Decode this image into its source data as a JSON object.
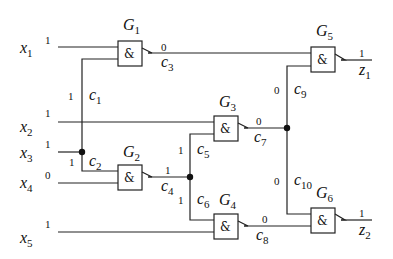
{
  "diagram": {
    "type": "logic-circuit",
    "gate_symbol": "&",
    "inputs": [
      {
        "id": "x1",
        "name": "x",
        "sub": "1",
        "value": "1"
      },
      {
        "id": "x2",
        "name": "x",
        "sub": "2",
        "value": "1"
      },
      {
        "id": "x3",
        "name": "x",
        "sub": "3",
        "value": "1"
      },
      {
        "id": "x4",
        "name": "x",
        "sub": "4",
        "value": "0"
      },
      {
        "id": "x5",
        "name": "x",
        "sub": "5",
        "value": "1"
      }
    ],
    "gates": [
      {
        "id": "G1",
        "name": "G",
        "sub": "1",
        "symbol": "&"
      },
      {
        "id": "G2",
        "name": "G",
        "sub": "2",
        "symbol": "&"
      },
      {
        "id": "G3",
        "name": "G",
        "sub": "3",
        "symbol": "&"
      },
      {
        "id": "G4",
        "name": "G",
        "sub": "4",
        "symbol": "&"
      },
      {
        "id": "G5",
        "name": "G",
        "sub": "5",
        "symbol": "&"
      },
      {
        "id": "G6",
        "name": "G",
        "sub": "6",
        "symbol": "&"
      }
    ],
    "connections": [
      {
        "id": "c1",
        "name": "c",
        "sub": "1",
        "value": "1"
      },
      {
        "id": "c2",
        "name": "c",
        "sub": "2",
        "value": "1"
      },
      {
        "id": "c3",
        "name": "c",
        "sub": "3",
        "value": "0"
      },
      {
        "id": "c4",
        "name": "c",
        "sub": "4",
        "value": "1"
      },
      {
        "id": "c5",
        "name": "c",
        "sub": "5",
        "value": "1"
      },
      {
        "id": "c6",
        "name": "c",
        "sub": "6",
        "value": "1"
      },
      {
        "id": "c7",
        "name": "c",
        "sub": "7",
        "value": "0"
      },
      {
        "id": "c8",
        "name": "c",
        "sub": "8",
        "value": "0"
      },
      {
        "id": "c9",
        "name": "c",
        "sub": "9",
        "value": "0"
      },
      {
        "id": "c10",
        "name": "c",
        "sub": "10",
        "value": "0"
      }
    ],
    "outputs": [
      {
        "id": "z1",
        "name": "z",
        "sub": "1",
        "value": "1"
      },
      {
        "id": "z2",
        "name": "z",
        "sub": "2",
        "value": "1"
      }
    ]
  }
}
